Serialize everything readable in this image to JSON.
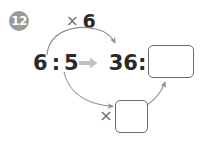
{
  "problem": {
    "number": "12"
  },
  "top_operation": {
    "operator_symbol": "×",
    "factor": "6"
  },
  "equation": {
    "left_ratio": {
      "antecedent": "6",
      "separator": ":",
      "consequent": "5"
    },
    "transform_arrow": "right-arrow",
    "right_ratio": {
      "antecedent": "36",
      "separator": ":",
      "consequent": ""
    }
  },
  "bottom_operation": {
    "operator_symbol": "×",
    "factor": ""
  },
  "boxes": {
    "main_answer_value": "",
    "factor_answer_value": ""
  },
  "colors": {
    "badge_fill": "#9a9a9a",
    "badge_text": "#ffffff",
    "text_dark": "#2a2a2a",
    "operator_gray": "#6f6f6f",
    "arrow_gray": "#b9b9b9",
    "curve_gray": "#8d8d8d",
    "box_border": "#6a6a6a",
    "background": "#ffffff"
  }
}
